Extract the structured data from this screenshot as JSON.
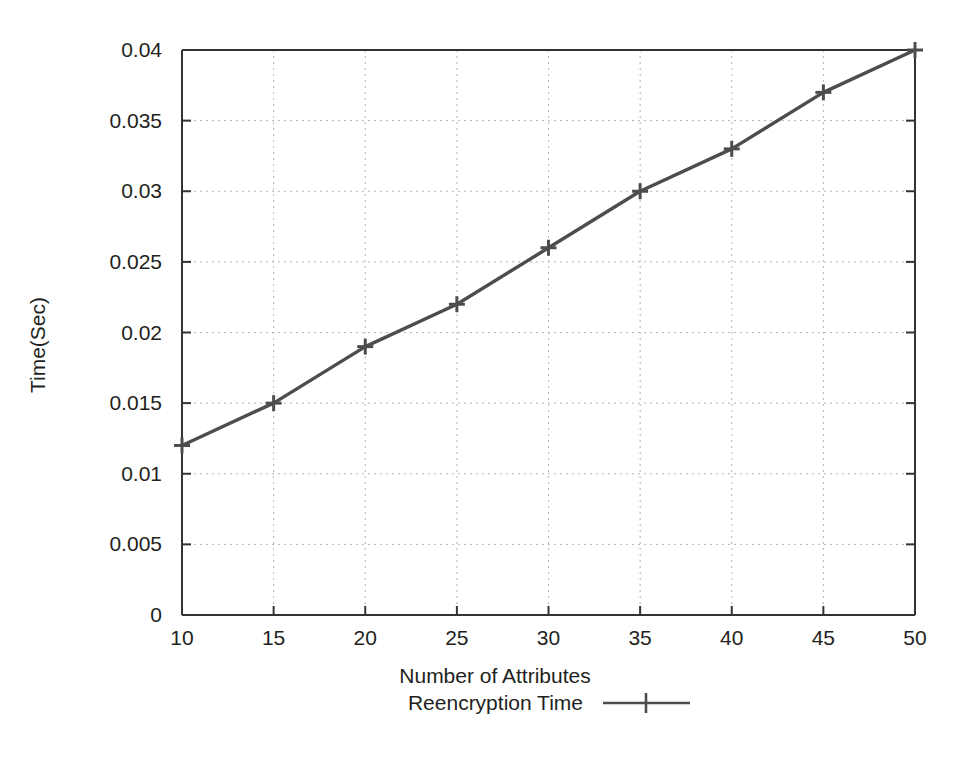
{
  "chart_data": {
    "type": "line",
    "title": "",
    "xlabel": "Number of Attributes",
    "ylabel": "Time(Sec)",
    "xlim": [
      10,
      50
    ],
    "ylim": [
      0,
      0.04
    ],
    "grid": true,
    "legend_position": "below-axis-label",
    "x": [
      10,
      15,
      20,
      25,
      30,
      35,
      40,
      45,
      50
    ],
    "xticklabels": [
      "10",
      "15",
      "20",
      "25",
      "30",
      "35",
      "40",
      "45",
      "50"
    ],
    "yticks": [
      0,
      0.005,
      0.01,
      0.015,
      0.02,
      0.025,
      0.03,
      0.035,
      0.04
    ],
    "yticklabels": [
      "0",
      "0.005",
      "0.01",
      "0.015",
      "0.02",
      "0.025",
      "0.03",
      "0.035",
      "0.04"
    ],
    "series": [
      {
        "name": "Reencryption Time",
        "values": [
          0.012,
          0.015,
          0.019,
          0.022,
          0.026,
          0.03,
          0.033,
          0.037,
          0.04
        ],
        "color": "#4d4d4d",
        "marker": "plus",
        "line_style": "solid"
      }
    ]
  },
  "legend": {
    "entries": [
      {
        "label": "Reencryption Time",
        "marker": "line-plus-marker"
      }
    ]
  },
  "axes": {
    "x_title": "Number of Attributes",
    "y_title": "Time(Sec)"
  },
  "colors": {
    "line": "#4d4d4d",
    "axis": "#333333",
    "grid": "#b3b3b3",
    "text": "#231f20",
    "background": "#ffffff"
  }
}
